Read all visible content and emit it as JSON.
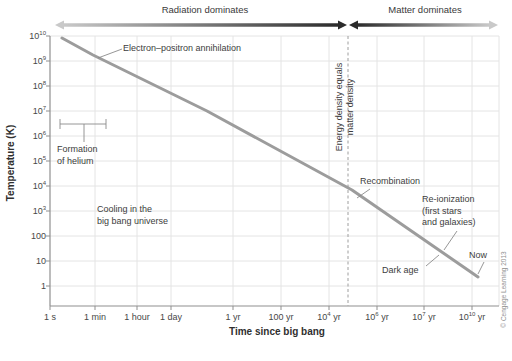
{
  "header": {
    "radiation_label": "Radiation dominates",
    "matter_label": "Matter dominates"
  },
  "axes": {
    "y_title": "Temperature (K)",
    "x_title": "Time since big bang",
    "y_ticks": [
      {
        "b": "10",
        "e": "10",
        "px": 36
      },
      {
        "b": "10",
        "e": "9",
        "px": 61
      },
      {
        "b": "10",
        "e": "8",
        "px": 86
      },
      {
        "b": "10",
        "e": "7",
        "px": 111
      },
      {
        "b": "10",
        "e": "6",
        "px": 136
      },
      {
        "b": "10",
        "e": "5",
        "px": 161
      },
      {
        "b": "10",
        "e": "4",
        "px": 186
      },
      {
        "b": "10",
        "e": "3",
        "px": 211
      },
      {
        "b": "100",
        "e": "",
        "px": 236
      },
      {
        "b": "10",
        "e": "",
        "px": 261
      },
      {
        "b": "1",
        "e": "",
        "px": 286
      }
    ],
    "x_ticks": [
      {
        "b": "1 s",
        "e": "",
        "s": "",
        "px": 50
      },
      {
        "b": "1 min",
        "e": "",
        "s": "",
        "px": 95
      },
      {
        "b": "1 hour",
        "e": "",
        "s": "",
        "px": 137
      },
      {
        "b": "1 day",
        "e": "",
        "s": "",
        "px": 171
      },
      {
        "b": "1 yr",
        "e": "",
        "s": "",
        "px": 233
      },
      {
        "b": "100 yr",
        "e": "",
        "s": "",
        "px": 281
      },
      {
        "b": "10",
        "e": "4",
        "s": " yr",
        "px": 329
      },
      {
        "b": "10",
        "e": "6",
        "s": " yr",
        "px": 377
      },
      {
        "b": "10",
        "e": "7",
        "s": " yr",
        "px": 424
      },
      {
        "b": "10",
        "e": "10",
        "s": " yr",
        "px": 472
      }
    ]
  },
  "annotations": {
    "electron": "Electron–positron annihilation",
    "formation": [
      "Formation",
      "of helium"
    ],
    "cooling": [
      "Cooling in the",
      "big bang universe"
    ],
    "energy": [
      "Energy density equals",
      "matter density"
    ],
    "recombination": "Recombination",
    "reionization": [
      "Re-ionization",
      "(first stars",
      "and galaxies)"
    ],
    "dark_age": "Dark age",
    "now": "Now"
  },
  "credit": "© Cengage Learning 2013",
  "colors": {
    "curve": "#9c9c9c",
    "grid": "#e4e4e4",
    "axis": "#8f8f8f",
    "dashed": "#9e9e9e",
    "leader": "#8a8a8a",
    "arrow_light": "#c9c9c9",
    "arrow_dark": "#2b2b2b"
  },
  "chart_px": {
    "plot": {
      "left": 50,
      "top": 36,
      "right": 499,
      "bottom": 306
    },
    "hgrid": [
      36,
      61,
      86,
      111,
      136,
      161,
      186,
      211,
      236,
      261,
      286
    ],
    "vgrid": [
      95,
      137,
      171,
      233,
      281,
      329,
      377,
      424,
      472,
      499
    ],
    "dashed_x": 348,
    "curve": "62,38 93,55 207,111 352,190 478,277",
    "segments": [
      [
        122,
        49,
        98,
        58
      ],
      [
        60,
        124,
        106,
        124
      ],
      [
        60,
        119,
        60,
        129
      ],
      [
        106,
        119,
        106,
        129
      ],
      [
        84,
        124,
        84,
        142
      ],
      [
        370,
        189,
        357,
        198
      ],
      [
        457,
        231,
        444,
        250
      ],
      [
        426,
        266,
        439,
        255
      ],
      [
        484,
        262,
        478,
        274
      ]
    ]
  },
  "chart_data": {
    "type": "line",
    "title": "Cooling in the big bang universe",
    "xlabel": "Time since big bang",
    "ylabel": "Temperature (K)",
    "x_scale": "log",
    "y_scale": "log",
    "x_tick_labels": [
      "1 s",
      "1 min",
      "1 hour",
      "1 day",
      "1 yr",
      "100 yr",
      "10^4 yr",
      "10^6 yr",
      "10^7 yr",
      "10^10 yr"
    ],
    "y_tick_labels": [
      "10^10",
      "10^9",
      "10^8",
      "10^7",
      "10^6",
      "10^5",
      "10^4",
      "10^3",
      "100",
      "10",
      "1"
    ],
    "ylim": [
      "~0.2",
      "1e10"
    ],
    "grid": true,
    "series": [
      {
        "name": "Temperature of the universe",
        "points": [
          {
            "t": "~2 s",
            "T_K": 8000000000.0
          },
          {
            "t": "~1 min",
            "T_K": 2000000000.0
          },
          {
            "t": "~1 month",
            "T_K": 10000000.0
          },
          {
            "t": "~8e4 yr",
            "T_K": 7000
          },
          {
            "t": "~1e10 yr (now)",
            "T_K": 2.5
          }
        ]
      }
    ],
    "events": [
      {
        "label": "Electron–positron annihilation",
        "t": "~1 min",
        "T_K": 2000000000.0
      },
      {
        "label": "Formation of helium",
        "t_range": "~3 s to ~3 min",
        "T_K": 1000000.0
      },
      {
        "label": "Energy density equals matter density",
        "t": "~5e4 yr",
        "marker": "vertical dashed line"
      },
      {
        "label": "Recombination",
        "t": "~1e5 yr",
        "T_K": 4000
      },
      {
        "label": "Dark age",
        "t": "~1e6–1e8 yr"
      },
      {
        "label": "Re-ionization (first stars and galaxies)",
        "t": "~1e8 yr"
      },
      {
        "label": "Now",
        "t": "~1e10 yr",
        "T_K": 2.5
      }
    ],
    "regions": [
      {
        "label": "Radiation dominates",
        "range": "1 s to ~5e4 yr"
      },
      {
        "label": "Matter dominates",
        "range": "~5e4 yr to now"
      }
    ]
  }
}
